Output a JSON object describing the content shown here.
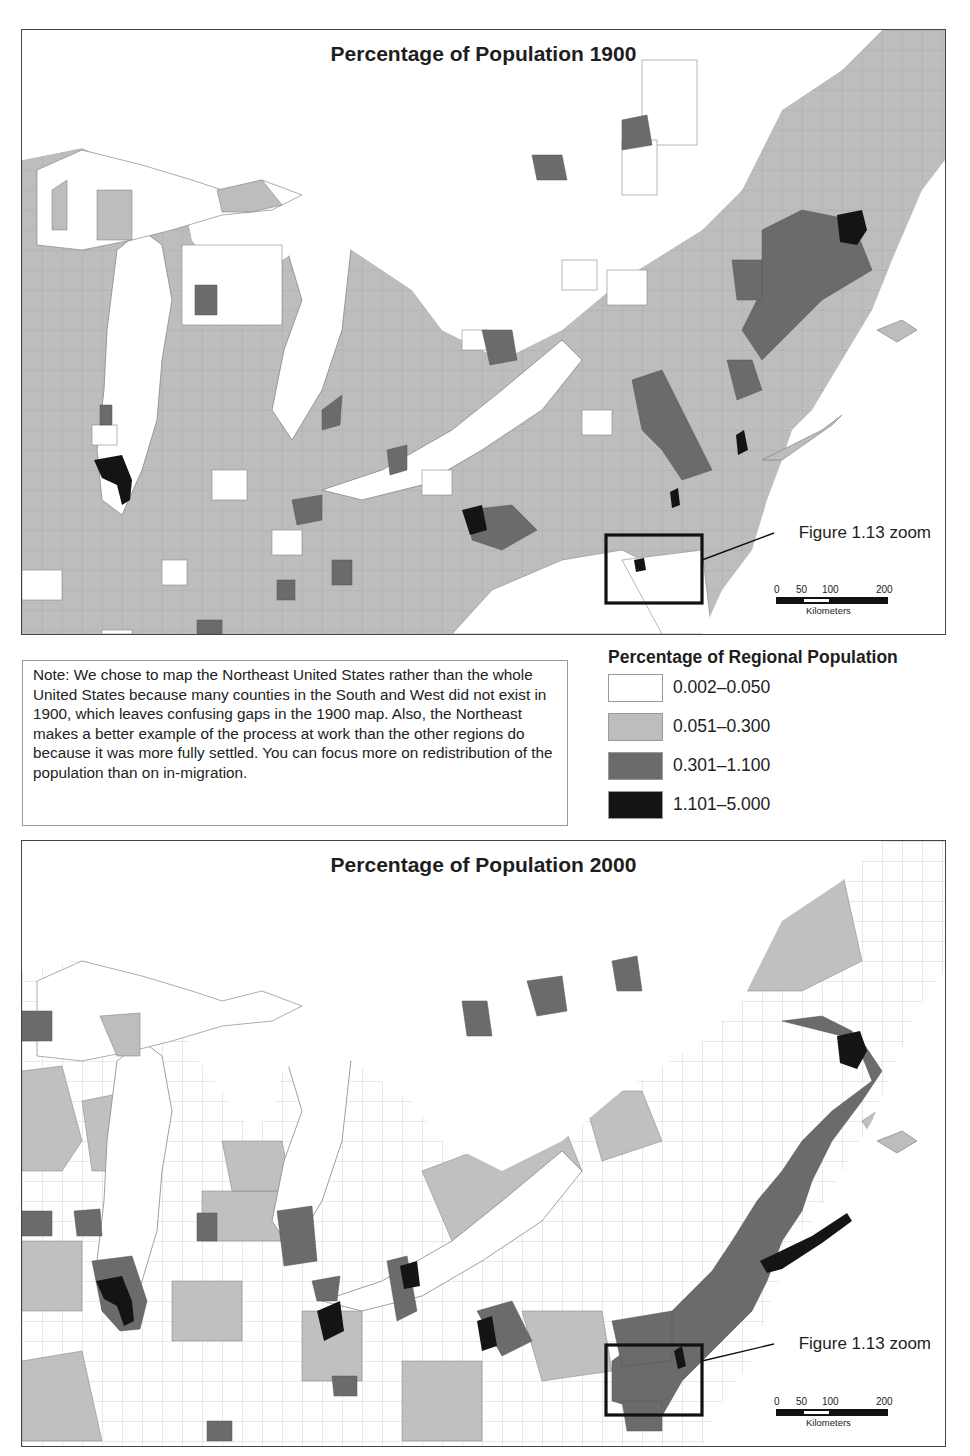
{
  "maps": [
    {
      "title": "Percentage of Population 1900",
      "year": 1900,
      "zoom_box_label": "Figure 1.13 zoom",
      "scale_bar": {
        "ticks": [
          "0",
          "50",
          "100",
          "200"
        ],
        "unit": "Kilometers"
      }
    },
    {
      "title": "Percentage of Population 2000",
      "year": 2000,
      "zoom_box_label": "Figure 1.13 zoom",
      "scale_bar": {
        "ticks": [
          "0",
          "50",
          "100",
          "200"
        ],
        "unit": "Kilometers"
      }
    }
  ],
  "note": {
    "text": "Note: We chose to map the Northeast United States rather than the whole United States because many counties in the South and West did not exist in 1900, which leaves confusing gaps in the 1900 map.  Also, the Northeast makes a better example of the process at work than the other regions do because it was more fully settled.  You can focus more on redistribution of the population than on in-migration."
  },
  "legend": {
    "title": "Percentage of Regional Population",
    "classes": [
      {
        "label": "0.002–0.050",
        "min": 0.002,
        "max": 0.05,
        "color": "#ffffff"
      },
      {
        "label": "0.051–0.300",
        "min": 0.051,
        "max": 0.3,
        "color": "#bdbdbd"
      },
      {
        "label": "0.301–1.100",
        "min": 0.301,
        "max": 1.1,
        "color": "#6b6b6b"
      },
      {
        "label": "1.101–5.000",
        "min": 1.101,
        "max": 5.0,
        "color": "#141414"
      }
    ]
  },
  "colors": {
    "water": "#ffffff",
    "county_border": "#6e6e6e",
    "frame": "#444444"
  }
}
